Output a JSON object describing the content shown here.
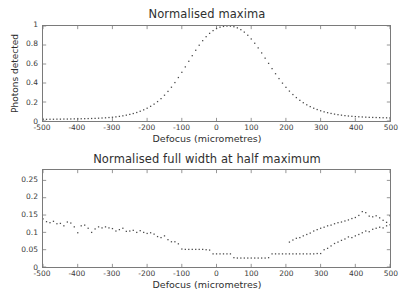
{
  "figure": {
    "background": "#ffffff",
    "marker_color": "#4a4a4a",
    "axis_color": "#7a7a7a"
  },
  "chart_data": [
    {
      "id": "normalised-maxima",
      "type": "scatter",
      "title": "Normalised maxima",
      "xlabel": "Defocus (micrometres)",
      "ylabel": "Photons detected",
      "xlim": [
        -500,
        500
      ],
      "ylim": [
        0,
        1
      ],
      "xticks": [
        -500,
        -400,
        -300,
        -200,
        -100,
        0,
        100,
        200,
        300,
        400,
        500
      ],
      "xticklabels": [
        "-500",
        "-400",
        "-300",
        "-200",
        "-100",
        "0",
        "100",
        "200",
        "300",
        "400",
        "500"
      ],
      "yticks": [
        0,
        0.2,
        0.4,
        0.6,
        0.8,
        1
      ],
      "yticklabels": [
        "0",
        "0.2",
        "0.4",
        "0.6",
        "0.8",
        "1"
      ],
      "grid": false,
      "legend": null,
      "marker": "dot",
      "x": [
        -500,
        -490,
        -480,
        -470,
        -460,
        -450,
        -440,
        -430,
        -420,
        -410,
        -400,
        -390,
        -380,
        -370,
        -360,
        -350,
        -340,
        -330,
        -320,
        -310,
        -300,
        -290,
        -280,
        -270,
        -260,
        -250,
        -240,
        -230,
        -220,
        -210,
        -200,
        -190,
        -180,
        -170,
        -160,
        -150,
        -140,
        -130,
        -120,
        -110,
        -100,
        -90,
        -80,
        -70,
        -60,
        -50,
        -40,
        -30,
        -20,
        -10,
        0,
        10,
        20,
        30,
        40,
        50,
        60,
        70,
        80,
        90,
        100,
        110,
        120,
        130,
        140,
        150,
        160,
        170,
        180,
        190,
        200,
        210,
        220,
        230,
        240,
        250,
        260,
        270,
        280,
        290,
        300,
        310,
        320,
        330,
        340,
        350,
        360,
        370,
        380,
        390,
        400,
        410,
        420,
        430,
        440,
        450,
        460,
        470,
        480,
        490,
        500
      ],
      "y": [
        0.018,
        0.018,
        0.019,
        0.019,
        0.02,
        0.02,
        0.021,
        0.021,
        0.022,
        0.023,
        0.023,
        0.024,
        0.025,
        0.026,
        0.027,
        0.028,
        0.03,
        0.032,
        0.034,
        0.037,
        0.04,
        0.044,
        0.049,
        0.055,
        0.062,
        0.07,
        0.079,
        0.09,
        0.103,
        0.118,
        0.135,
        0.155,
        0.178,
        0.205,
        0.236,
        0.272,
        0.312,
        0.356,
        0.405,
        0.458,
        0.513,
        0.57,
        0.629,
        0.688,
        0.745,
        0.798,
        0.846,
        0.888,
        0.923,
        0.952,
        0.974,
        0.988,
        0.996,
        1.0,
        0.999,
        0.993,
        0.981,
        0.962,
        0.936,
        0.903,
        0.864,
        0.819,
        0.77,
        0.717,
        0.662,
        0.607,
        0.552,
        0.498,
        0.447,
        0.399,
        0.355,
        0.315,
        0.279,
        0.247,
        0.218,
        0.193,
        0.171,
        0.152,
        0.135,
        0.121,
        0.108,
        0.097,
        0.088,
        0.08,
        0.073,
        0.067,
        0.062,
        0.057,
        0.053,
        0.05,
        0.047,
        0.045,
        0.043,
        0.041,
        0.039,
        0.038,
        0.037,
        0.036,
        0.035,
        0.034,
        0.034
      ]
    },
    {
      "id": "normalised-fwhm",
      "type": "scatter",
      "title": "Normalised full width at half maximum",
      "xlabel": "Defocus (micrometres)",
      "ylabel": "",
      "xlim": [
        -500,
        500
      ],
      "ylim": [
        0,
        0.28
      ],
      "xticks": [
        -500,
        -400,
        -300,
        -200,
        -100,
        0,
        100,
        200,
        300,
        400,
        500
      ],
      "xticklabels": [
        "-500",
        "-400",
        "-300",
        "-200",
        "-100",
        "0",
        "100",
        "200",
        "300",
        "400",
        "500"
      ],
      "yticks": [
        0,
        0.05,
        0.1,
        0.15,
        0.2,
        0.25
      ],
      "yticklabels": [
        "0",
        "0.05",
        "0.1",
        "0.15",
        "0.2",
        "0.25"
      ],
      "grid": false,
      "legend": null,
      "marker": "dot",
      "x": [
        -500,
        -490,
        -480,
        -470,
        -460,
        -450,
        -440,
        -430,
        -420,
        -410,
        -400,
        -390,
        -380,
        -370,
        -360,
        -350,
        -340,
        -330,
        -320,
        -310,
        -300,
        -290,
        -280,
        -270,
        -260,
        -250,
        -240,
        -230,
        -220,
        -210,
        -200,
        -190,
        -180,
        -170,
        -160,
        -150,
        -140,
        -130,
        -120,
        -110,
        -100,
        -90,
        -80,
        -70,
        -60,
        -50,
        -40,
        -30,
        -20,
        -10,
        0,
        10,
        20,
        30,
        40,
        50,
        60,
        70,
        80,
        90,
        100,
        110,
        120,
        130,
        140,
        150,
        160,
        170,
        180,
        190,
        200,
        210,
        220,
        230,
        240,
        250,
        260,
        270,
        280,
        290,
        300,
        310,
        320,
        330,
        340,
        350,
        360,
        370,
        380,
        390,
        400,
        410,
        420,
        430,
        440,
        450,
        460,
        470,
        480,
        490,
        500
      ],
      "y": [
        0.139,
        0.131,
        0.128,
        0.132,
        0.125,
        0.126,
        0.119,
        0.13,
        0.127,
        0.116,
        0.099,
        0.119,
        0.121,
        0.112,
        0.1,
        0.11,
        0.116,
        0.113,
        0.116,
        0.113,
        0.111,
        0.104,
        0.108,
        0.112,
        0.103,
        0.104,
        0.106,
        0.1,
        0.105,
        0.1,
        0.097,
        0.099,
        0.095,
        0.088,
        0.085,
        0.09,
        0.079,
        0.073,
        0.073,
        0.067,
        0.052,
        0.051,
        0.051,
        0.051,
        0.051,
        0.051,
        0.051,
        0.05,
        0.049,
        0.038,
        0.038,
        0.038,
        0.038,
        0.038,
        0.038,
        0.027,
        0.026,
        0.026,
        0.026,
        0.026,
        0.026,
        0.026,
        0.026,
        0.026,
        0.026,
        0.027,
        0.038,
        0.038,
        0.038,
        0.038,
        0.038,
        0.038,
        0.038,
        0.038,
        0.038,
        0.038,
        0.038,
        0.038,
        0.038,
        0.039,
        0.039,
        0.05,
        0.054,
        0.061,
        0.068,
        0.072,
        0.077,
        0.081,
        0.087,
        0.085,
        0.09,
        0.094,
        0.099,
        0.104,
        0.102,
        0.109,
        0.112,
        0.115,
        0.113,
        0.119,
        0.122
      ]
    }
  ],
  "fwhm_extra_points": {
    "comment_not_rendered": false,
    "x": [
      210,
      220,
      230,
      240,
      250,
      260,
      270,
      280,
      290,
      300,
      310,
      320,
      330,
      340,
      350,
      360,
      370,
      380,
      390,
      400,
      410,
      420,
      430,
      440,
      450,
      460,
      470,
      480,
      490,
      500
    ],
    "y": [
      0.072,
      0.078,
      0.083,
      0.085,
      0.09,
      0.094,
      0.098,
      0.104,
      0.108,
      0.112,
      0.115,
      0.119,
      0.121,
      0.125,
      0.128,
      0.13,
      0.133,
      0.136,
      0.14,
      0.143,
      0.149,
      0.16,
      0.157,
      0.147,
      0.145,
      0.148,
      0.142,
      0.135,
      0.129,
      0.148
    ]
  }
}
